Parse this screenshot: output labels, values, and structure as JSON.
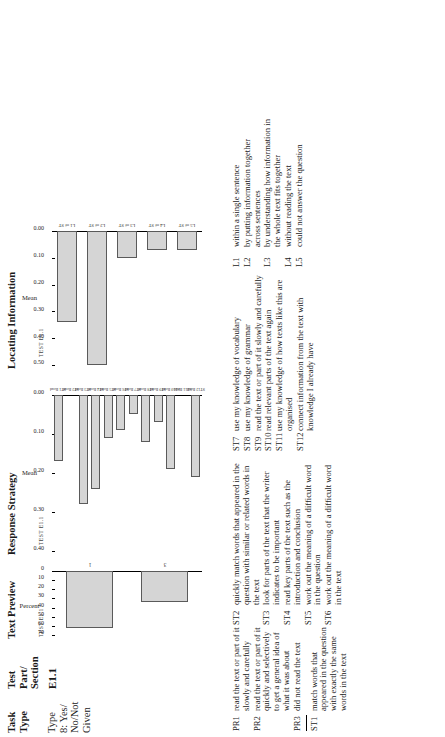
{
  "table": {
    "headers": {
      "task_type": "Task\nType",
      "test_part_section": "Test\nPart/\nSection",
      "text_preview": "Text Preview",
      "response_strategy": "Response Strategy",
      "locating_information": "Locating Information"
    },
    "row": {
      "task_type": "Type\n8: Yes/\nNo/Not\nGiven",
      "test_part_section": "E1.1"
    }
  },
  "chart_data": [
    {
      "type": "bar",
      "title": "TEST E1.1",
      "name": "Text Preview",
      "categories": [
        "1",
        "3"
      ],
      "values": [
        62,
        34
      ],
      "xlabel": "Pre-read",
      "ylabel": "Percent",
      "ylim": [
        0,
        70
      ],
      "yticks": [
        0,
        10,
        20,
        30,
        40,
        50,
        60,
        70
      ],
      "ytick_labels": [
        "0",
        "10",
        "20",
        "30",
        "40",
        "50",
        "60",
        "70"
      ],
      "grid": false,
      "legend": "none"
    },
    {
      "type": "bar",
      "title": "TEST E1.1",
      "name": "Response Strategy",
      "categories": [
        "ST1 Read",
        "ST2 Read",
        "ST3 Read",
        "ST4 Read",
        "ST5 Read",
        "ST6 Read",
        "ST7 Read",
        "ST8 Read",
        "ST9 Read",
        "ST10 Read",
        "ST11 Read",
        "ST12 Read"
      ],
      "values": [
        0.17,
        0.0,
        0.28,
        0.24,
        0.11,
        0.09,
        0.05,
        0.12,
        0.07,
        0.19,
        0.0,
        0.21
      ],
      "xlabel": "",
      "ylabel": "Mean",
      "ylim": [
        0.0,
        0.4
      ],
      "yticks": [
        0.0,
        0.1,
        0.2,
        0.3,
        0.4
      ],
      "ytick_labels": [
        "0.00",
        "0.10",
        "0.20",
        "0.30",
        "0.40"
      ],
      "grid": false,
      "legend": "none"
    },
    {
      "type": "bar",
      "title": "TEST E1.1",
      "name": "Locating Information",
      "categories": [
        "L1 of ST",
        "L2 of ST",
        "L3 of ST",
        "L4 of ST",
        "L5 of ST"
      ],
      "values": [
        0.34,
        0.5,
        0.1,
        0.07,
        0.07
      ],
      "xlabel": "",
      "ylabel": "Mean",
      "ylim": [
        0.0,
        0.5
      ],
      "yticks": [
        0.0,
        0.1,
        0.2,
        0.3,
        0.4,
        0.5
      ],
      "ytick_labels": [
        "0.00",
        "0.10",
        "0.20",
        "0.30",
        "0.40",
        "0.50"
      ],
      "grid": false,
      "legend": "none"
    }
  ],
  "legends": {
    "pre_read": [
      {
        "key": "PR1",
        "text": "read the text or part of it slowly and carefully"
      },
      {
        "key": "PR2",
        "text": "read the text or part of it quickly and selectively to get a general idea of what it was about"
      },
      {
        "key": "PR3",
        "text": "did not read the text"
      }
    ],
    "strategy_left": [
      {
        "key": "ST1",
        "text": "match words that appeared in the question with exactly the same words in the text"
      },
      {
        "key": "ST2",
        "text": "quickly match words that appeared in the question with similar or related words in the text"
      },
      {
        "key": "ST3",
        "text": "look for parts of the text that the writer indicates to be important"
      },
      {
        "key": "ST4",
        "text": "read key parts of the text such as the introduction and conclusion"
      },
      {
        "key": "ST5",
        "text": "work out the meaning of a difficult word in the question"
      },
      {
        "key": "ST6",
        "text": "work out the meaning of a difficult word in the text"
      }
    ],
    "strategy_right": [
      {
        "key": "ST7",
        "text": "use my knowledge of vocabulary"
      },
      {
        "key": "ST8",
        "text": "use my knowledge of grammar"
      },
      {
        "key": "ST9",
        "text": "read the text or part of it slowly and carefully"
      },
      {
        "key": "ST10",
        "text": "read relevant parts of the text again"
      },
      {
        "key": "ST11",
        "text": "use my knowledge of how texts like this are organised"
      },
      {
        "key": "ST12",
        "text": "connect information from the text with knowledge I already have"
      }
    ],
    "locating": [
      {
        "key": "L1",
        "text": "within a single sentence"
      },
      {
        "key": "L2",
        "text": "by putting information together across sentences"
      },
      {
        "key": "L3",
        "text": "by understanding how information in the whole text fits together"
      },
      {
        "key": "L4",
        "text": "without reading the text"
      },
      {
        "key": "L5",
        "text": "could not answer the question"
      }
    ]
  },
  "colors": {
    "bar_fill": "#d5d5d5",
    "bar_stroke": "#5a5a5a",
    "axis": "#000000",
    "text": "#1a1a1a"
  }
}
